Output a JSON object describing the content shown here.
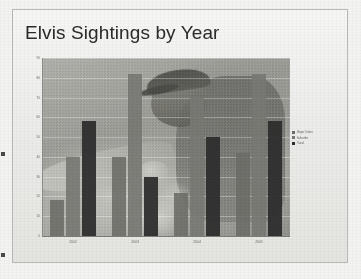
{
  "slide": {
    "title": "Elvis Sightings by Year"
  },
  "chart_data": {
    "type": "bar",
    "title": "Elvis Sightings by Year",
    "xlabel": "",
    "ylabel": "",
    "ylim": [
      0,
      90
    ],
    "grid": true,
    "legend_position": "right",
    "categories": [
      "2002",
      "2003",
      "2004",
      "2005"
    ],
    "yticks": [
      "90",
      "80",
      "70",
      "60",
      "50",
      "40",
      "30",
      "20",
      "10",
      "0"
    ],
    "series": [
      {
        "name": "Major Cities",
        "color": "#6c6c68",
        "values": [
          18,
          40,
          22,
          42
        ]
      },
      {
        "name": "Suburbs",
        "color": "#787874",
        "values": [
          40,
          82,
          70,
          82
        ]
      },
      {
        "name": "Rural",
        "color": "#2e2e2e",
        "values": [
          58,
          30,
          50,
          58
        ]
      }
    ]
  },
  "legend": {
    "items": [
      {
        "label": "Major Cities"
      },
      {
        "label": "Suburbs"
      },
      {
        "label": "Rural"
      }
    ]
  }
}
